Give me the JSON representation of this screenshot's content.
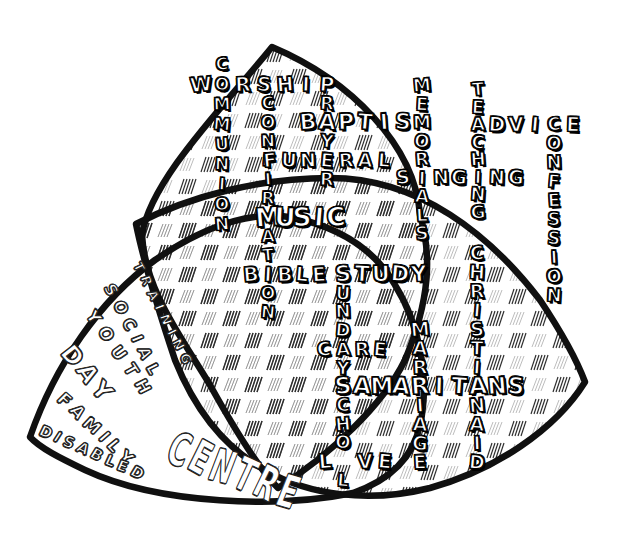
{
  "figure": {
    "background": "#ffffff",
    "ink": "#101010",
    "hatch_dark": "#2f2f2f",
    "hatch_light": "#6a6a6a",
    "petals": [
      "top-petal",
      "bottom-left-petal",
      "right-petal"
    ]
  },
  "crossword_words": [
    {
      "text": "WORSHIP",
      "dir": "h",
      "x": 201,
      "y": 85,
      "step": 21,
      "size": 20,
      "skip": [
        1
      ]
    },
    {
      "text": "COMMUNION",
      "dir": "v",
      "x": 222,
      "y": 65,
      "step": 20,
      "size": 17,
      "skip": []
    },
    {
      "text": "CONFIRMATION",
      "dir": "v",
      "x": 268,
      "y": 104,
      "step": 19,
      "size": 17,
      "skip": [
        6,
        9
      ]
    },
    {
      "text": "PRAYER",
      "dir": "v",
      "x": 327,
      "y": 85,
      "step": 19,
      "size": 18,
      "skip": [
        0,
        2,
        4
      ]
    },
    {
      "text": "BAPTISM",
      "dir": "h",
      "x": 308,
      "y": 123,
      "step": 19,
      "size": 22,
      "skip": [
        6
      ]
    },
    {
      "text": "MEMORIALS",
      "dir": "v",
      "x": 422,
      "y": 86,
      "step": 18.5,
      "size": 18,
      "skip": []
    },
    {
      "text": "TEACHING",
      "dir": "v",
      "x": 478,
      "y": 90,
      "step": 17.5,
      "size": 18,
      "skip": []
    },
    {
      "text": "ADVICE",
      "dir": "h",
      "x": 478,
      "y": 125,
      "step": 19,
      "size": 20,
      "skip": [
        0,
        4
      ]
    },
    {
      "text": "CONFESSION",
      "dir": "v",
      "x": 554,
      "y": 125,
      "step": 19,
      "size": 18,
      "skip": []
    },
    {
      "text": "FUNERAL",
      "dir": "h",
      "x": 270,
      "y": 161,
      "step": 19,
      "size": 19,
      "skip": []
    },
    {
      "text": "SINGING",
      "dir": "h",
      "x": 403,
      "y": 178,
      "step": 18.8,
      "size": 19,
      "skip": [
        1,
        4
      ]
    },
    {
      "text": "MUSIC",
      "dir": "h",
      "x": 268,
      "y": 218,
      "step": 17,
      "size": 26,
      "skip": []
    },
    {
      "text": "BIBLE",
      "dir": "h",
      "x": 251,
      "y": 275,
      "step": 17,
      "size": 20,
      "skip": []
    },
    {
      "text": "STUDY",
      "dir": "h",
      "x": 343,
      "y": 275,
      "step": 19,
      "size": 22,
      "skip": []
    },
    {
      "text": "SUNDAYSCHOOL",
      "dir": "v",
      "x": 343,
      "y": 275,
      "step": 18.7,
      "size": 18,
      "skip": [
        0,
        6,
        10
      ]
    },
    {
      "text": "CARE",
      "dir": "h",
      "x": 324.3,
      "y": 349.8,
      "step": 18.7,
      "size": 19,
      "skip": [
        1
      ]
    },
    {
      "text": "MARRIAGE",
      "dir": "v",
      "x": 420,
      "y": 330,
      "step": 19,
      "size": 19,
      "skip": [
        3
      ]
    },
    {
      "text": "CHRISTIANAID",
      "dir": "v",
      "x": 477,
      "y": 254,
      "step": 19,
      "size": 19,
      "skip": [
        7
      ]
    },
    {
      "text": "SAMARITANS",
      "dir": "h",
      "x": 343,
      "y": 387,
      "step": 19.25,
      "size": 23,
      "skip": []
    },
    {
      "text": "LOVE",
      "dir": "h",
      "x": 325,
      "y": 462,
      "step": 20,
      "size": 20,
      "skip": [
        1
      ]
    }
  ],
  "freeform_words": [
    {
      "text": "TRAINING",
      "x": 137,
      "y": 263,
      "rotate": 63,
      "size": 13,
      "spacing": 6,
      "scaleX": 1
    },
    {
      "text": "SOCIAL",
      "x": 108,
      "y": 285,
      "rotate": 62,
      "size": 16,
      "spacing": 7,
      "scaleX": 1
    },
    {
      "text": "YOUTH",
      "x": 90,
      "y": 312,
      "rotate": 55,
      "size": 17,
      "spacing": 8,
      "scaleX": 1
    },
    {
      "text": "DAY",
      "x": 66,
      "y": 348,
      "rotate": 50,
      "size": 24,
      "spacing": 4,
      "scaleX": 1
    },
    {
      "text": "FAMILY",
      "x": 60,
      "y": 396,
      "rotate": 43,
      "size": 17,
      "spacing": 5,
      "scaleX": 1
    },
    {
      "text": "DISABLED",
      "x": 40,
      "y": 430,
      "rotate": 24,
      "size": 15,
      "spacing": 4,
      "scaleX": 1
    },
    {
      "text": "CENTRE",
      "x": 170,
      "y": 446,
      "rotate": 21,
      "size": 46,
      "spacing": 5,
      "scaleX": 0.6
    }
  ]
}
